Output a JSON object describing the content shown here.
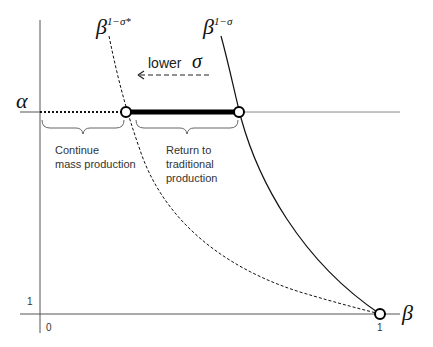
{
  "diagram": {
    "axes": {
      "y_axis_label": "α",
      "x_axis_label": "β",
      "origin_label": "0",
      "y_tick_label": "1",
      "x_tick_label": "1"
    },
    "curves": {
      "dashed_curve_base": "β",
      "dashed_curve_exponent": "1−σ*",
      "solid_curve_base": "β",
      "solid_curve_exponent": "1−σ"
    },
    "arrow": {
      "word": "lower",
      "symbol": "σ"
    },
    "regions": {
      "left_line1": "Continue",
      "left_line2": "mass production",
      "right_line1": "Return to",
      "right_line2": "traditional",
      "right_line3": "production"
    },
    "colors": {
      "line": "#111111",
      "axis": "#555555",
      "text": "#333333"
    }
  }
}
